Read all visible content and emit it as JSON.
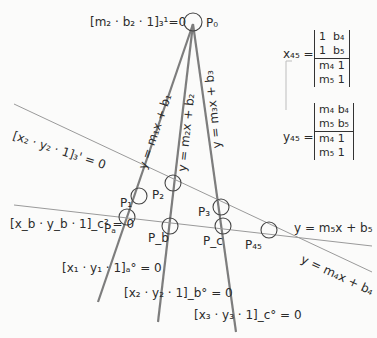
{
  "diagram": {
    "colors": {
      "line": "#8a8a8a",
      "heavy_line": "#7a7a7a",
      "circle": "#444444",
      "text": "#2b2b2b",
      "background": "#fbfbfa"
    },
    "top_equation": {
      "text": "[m₂ · b₂ · 1]₃¹=0"
    },
    "points": {
      "P0": "P₀",
      "P1": "P₁",
      "P2": "P₂",
      "P3": "P₃",
      "Pa": "Pₐ",
      "Pb": "P_b",
      "Pc": "P_c",
      "P45": "P₄₅"
    },
    "line_labels": {
      "line1": "y = m₁x + b₁",
      "line2": "y = m₂x + b₂",
      "line3": "y = m₃x + b₃",
      "line4": "y = m₄x + b₄",
      "line5": "y = m₅x + b₅"
    },
    "left_equations": {
      "upper": "[x₂ · y₂ · 1]₃' = 0",
      "lower": "[x_b · y_b · 1]_c² = 0"
    },
    "bottom_equations": {
      "eq1": "[x₁ · y₁ · 1]ₐ° = 0",
      "eq2": "[x₂ · y₂ · 1]_b° = 0",
      "eq3": "[x₃ · y₃ · 1]_c° = 0"
    },
    "determinants": {
      "x45": {
        "label": "x₄₅ =",
        "numerator": [
          [
            "1",
            "b₄"
          ],
          [
            "1",
            "b₅"
          ]
        ],
        "denominator": [
          [
            "m₄",
            "1"
          ],
          [
            "m₅",
            "1"
          ]
        ]
      },
      "y45": {
        "label": "y₄₅ =",
        "numerator": [
          [
            "m₄",
            "b₄"
          ],
          [
            "m₅",
            "b₅"
          ]
        ],
        "denominator": [
          [
            "m₄",
            "1"
          ],
          [
            "m₅",
            "1"
          ]
        ]
      }
    }
  }
}
